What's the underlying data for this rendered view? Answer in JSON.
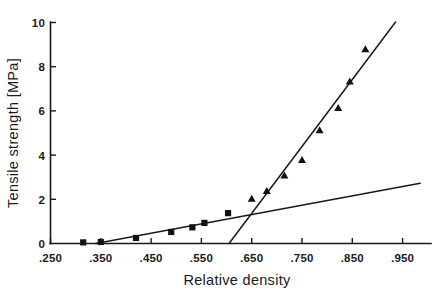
{
  "chart_data": {
    "type": "scatter",
    "title": "",
    "subtitle": "",
    "xlabel": "Relative density",
    "ylabel": "Tensile strength [MPa]",
    "xlim": [
      0.25,
      0.985
    ],
    "ylim": [
      0,
      10
    ],
    "grid": false,
    "legend": "none",
    "xticks": [
      0.25,
      0.35,
      0.45,
      0.55,
      0.65,
      0.75,
      0.85,
      0.95
    ],
    "xticklabels": [
      ".250",
      ".350",
      ".450",
      ".550",
      ".650",
      ".750",
      ".850",
      ".950"
    ],
    "yticks": [
      0,
      2,
      4,
      6,
      8,
      10
    ],
    "yticklabels": [
      "0",
      "2",
      "4",
      "6",
      "8",
      "10"
    ],
    "series": [
      {
        "name": "low-density-series",
        "marker": "square",
        "color": "#111111",
        "points": [
          {
            "x": 0.315,
            "y": 0.05
          },
          {
            "x": 0.35,
            "y": 0.07
          },
          {
            "x": 0.42,
            "y": 0.25
          },
          {
            "x": 0.49,
            "y": 0.52
          },
          {
            "x": 0.532,
            "y": 0.73
          },
          {
            "x": 0.556,
            "y": 0.93
          },
          {
            "x": 0.603,
            "y": 1.37
          }
        ]
      },
      {
        "name": "high-density-series",
        "marker": "triangle",
        "color": "#111111",
        "points": [
          {
            "x": 0.65,
            "y": 2.0
          },
          {
            "x": 0.68,
            "y": 2.35
          },
          {
            "x": 0.715,
            "y": 3.05
          },
          {
            "x": 0.75,
            "y": 3.75
          },
          {
            "x": 0.785,
            "y": 5.1
          },
          {
            "x": 0.822,
            "y": 6.1
          },
          {
            "x": 0.845,
            "y": 7.3
          },
          {
            "x": 0.876,
            "y": 8.75
          }
        ]
      }
    ],
    "fit_lines": [
      {
        "name": "shallow-fit-line",
        "x_start": 0.34,
        "y_start": 0.0,
        "x_end": 0.985,
        "y_end": 2.72,
        "color": "#1a1a1a"
      },
      {
        "name": "steep-fit-line",
        "x_start": 0.605,
        "y_start": 0.0,
        "x_end": 0.936,
        "y_end": 10.0,
        "color": "#1a1a1a"
      }
    ]
  }
}
